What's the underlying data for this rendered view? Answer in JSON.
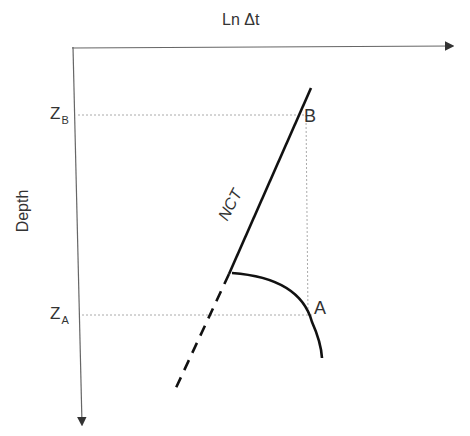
{
  "diagram": {
    "x_axis_label": "Ln Δt",
    "y_axis_label": "Depth",
    "depth_markers": [
      {
        "id": "ZB",
        "base": "Z",
        "sub": "B"
      },
      {
        "id": "ZA",
        "base": "Z",
        "sub": "A"
      }
    ],
    "points": {
      "B": "B",
      "A": "A"
    },
    "trend_label": "NCT",
    "colors": {
      "axis": "#555555",
      "line": "#111111",
      "guide": "#999999",
      "text": "#333333"
    }
  }
}
